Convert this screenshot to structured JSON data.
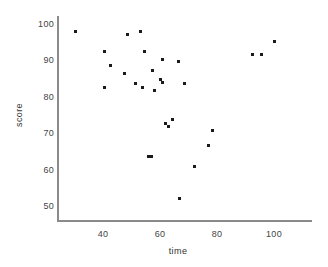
{
  "chart_data": {
    "type": "scatter",
    "title": "",
    "xlabel": "time",
    "ylabel": "score",
    "xlim": [
      22,
      113
    ],
    "ylim": [
      46,
      103
    ],
    "xticks": [
      40,
      60,
      80,
      100
    ],
    "yticks": [
      50,
      60,
      70,
      80,
      90,
      100
    ],
    "grid": false,
    "legend": null,
    "marker_color": "#1a1a1a",
    "axis_color": "#8a8a8a",
    "points": [
      {
        "x": 30.5,
        "y": 98.1
      },
      {
        "x": 53.0,
        "y": 98.1
      },
      {
        "x": 48.5,
        "y": 97.4
      },
      {
        "x": 100.0,
        "y": 95.6
      },
      {
        "x": 92.5,
        "y": 92.0
      },
      {
        "x": 95.5,
        "y": 92.0
      },
      {
        "x": 40.5,
        "y": 92.6
      },
      {
        "x": 54.5,
        "y": 92.6
      },
      {
        "x": 42.5,
        "y": 89.0
      },
      {
        "x": 61.0,
        "y": 90.6
      },
      {
        "x": 66.5,
        "y": 90.0
      },
      {
        "x": 47.5,
        "y": 86.8
      },
      {
        "x": 57.5,
        "y": 87.5
      },
      {
        "x": 60.0,
        "y": 85.0
      },
      {
        "x": 60.8,
        "y": 84.2
      },
      {
        "x": 51.5,
        "y": 83.8
      },
      {
        "x": 54.0,
        "y": 82.8
      },
      {
        "x": 40.5,
        "y": 82.7
      },
      {
        "x": 58.0,
        "y": 82.0
      },
      {
        "x": 68.5,
        "y": 83.8
      },
      {
        "x": 64.5,
        "y": 74.0
      },
      {
        "x": 62.0,
        "y": 73.0
      },
      {
        "x": 63.0,
        "y": 72.0
      },
      {
        "x": 78.5,
        "y": 71.0
      },
      {
        "x": 77.0,
        "y": 67.0
      },
      {
        "x": 56.0,
        "y": 64.0
      },
      {
        "x": 57.0,
        "y": 64.0
      },
      {
        "x": 72.0,
        "y": 61.0
      },
      {
        "x": 67.0,
        "y": 52.3
      }
    ]
  },
  "axes": {
    "x_ticks": [
      {
        "label": "40",
        "value": 40
      },
      {
        "label": "60",
        "value": 60
      },
      {
        "label": "80",
        "value": 80
      },
      {
        "label": "100",
        "value": 100
      }
    ],
    "y_ticks": [
      {
        "label": "100",
        "value": 100
      },
      {
        "label": "90",
        "value": 90
      },
      {
        "label": "80",
        "value": 80
      },
      {
        "label": "70",
        "value": 70
      },
      {
        "label": "60",
        "value": 60
      },
      {
        "label": "50",
        "value": 50
      }
    ]
  }
}
